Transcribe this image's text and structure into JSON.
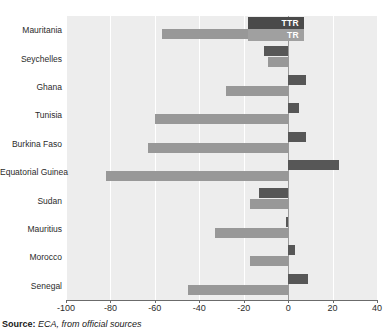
{
  "chart_data": {
    "type": "bar",
    "orientation": "horizontal",
    "title": "",
    "xlabel": "",
    "ylabel": "",
    "xlim": [
      -100,
      40
    ],
    "xticks": [
      -100,
      -80,
      -60,
      -40,
      -20,
      0,
      20,
      40
    ],
    "xtick_labels": [
      "-100",
      "-80",
      "-60",
      "-40",
      "-20",
      "0",
      "20",
      "40"
    ],
    "grid": true,
    "grid_axis": "x",
    "legend_position": "top-right",
    "categories": [
      "Mauritania",
      "Seychelles",
      "Ghana",
      "Tunisia",
      "Burkina Faso",
      "Equatorial Guinea",
      "Sudan",
      "Mauritius",
      "Morocco",
      "Senegal"
    ],
    "series": [
      {
        "name": "TTR",
        "color": "#575757",
        "values": [
          -12,
          -11,
          8,
          5,
          8,
          23,
          -13,
          -1,
          3,
          9
        ]
      },
      {
        "name": "TR",
        "color": "#989898",
        "values": [
          -57,
          -9,
          -28,
          -60,
          -63,
          -82,
          -17,
          -33,
          -17,
          -45
        ]
      }
    ]
  },
  "legend": {
    "items": [
      {
        "label": "TTR",
        "color": "#4a4a4a"
      },
      {
        "label": "TR",
        "color": "#a0a0a0"
      }
    ]
  },
  "source": {
    "label": "Source:",
    "text": "ECA, from official sources"
  }
}
